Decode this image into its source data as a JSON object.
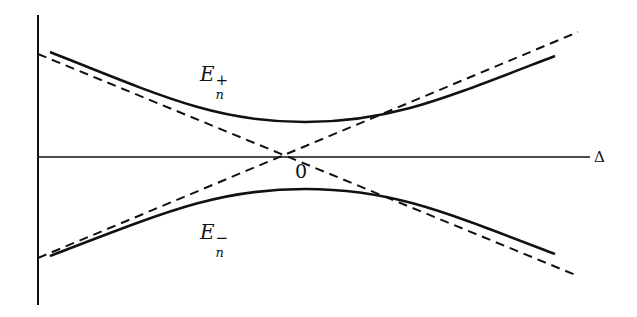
{
  "diagram": {
    "type": "avoided-crossing energy level diagram",
    "axis_label_x": "Δ",
    "origin_label": "0",
    "upper_curve": {
      "symbol": "E",
      "subscript": "n",
      "superscript": "+"
    },
    "lower_curve": {
      "symbol": "E",
      "subscript": "n",
      "superscript": "−"
    },
    "asymptotes": "dashed straight lines crossing at origin",
    "colors": {
      "ink": "#111111",
      "background": "#ffffff"
    }
  }
}
